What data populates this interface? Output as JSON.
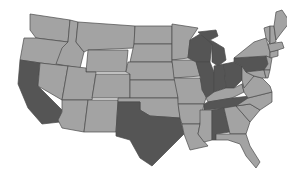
{
  "map": {
    "title": "United States map with highlighted states",
    "colors": {
      "background": "#ffffff",
      "default_state": "#a3a3a3",
      "highlighted_state": "#555555",
      "border": "#4a4a4a"
    },
    "highlighted_states": [
      "California",
      "Texas",
      "Wisconsin",
      "Michigan",
      "Illinois",
      "Indiana",
      "Ohio",
      "Pennsylvania",
      "Tennessee",
      "Alabama"
    ],
    "states": [
      {
        "id": "WA",
        "name": "Washington",
        "highlighted": false,
        "points": "30,14 70,20 68,42 36,38 30,30"
      },
      {
        "id": "OR",
        "name": "Oregon",
        "highlighted": false,
        "points": "24,38 36,38 68,42 62,66 20,60"
      },
      {
        "id": "CA",
        "name": "California",
        "highlighted": true,
        "points": "20,60 40,63 38,86 62,110 60,122 42,124 28,108 18,84"
      },
      {
        "id": "ID",
        "name": "Idaho",
        "highlighted": false,
        "points": "70,20 78,22 76,42 84,52 80,68 56,64 62,48 68,42"
      },
      {
        "id": "NV",
        "name": "Nevada",
        "highlighted": false,
        "points": "40,63 68,66 62,100 38,86"
      },
      {
        "id": "MT",
        "name": "Montana",
        "highlighted": false,
        "points": "78,22 135,26 134,48 88,50 84,52 76,42"
      },
      {
        "id": "WY",
        "name": "Wyoming",
        "highlighted": false,
        "points": "88,50 128,50 126,72 86,72"
      },
      {
        "id": "UT",
        "name": "Utah",
        "highlighted": false,
        "points": "68,66 86,68 86,72 96,72 92,100 62,100"
      },
      {
        "id": "CO",
        "name": "Colorado",
        "highlighted": false,
        "points": "96,74 130,74 130,98 92,98"
      },
      {
        "id": "AZ",
        "name": "Arizona",
        "highlighted": false,
        "points": "62,100 88,100 84,132 62,128 58,120 62,112"
      },
      {
        "id": "NM",
        "name": "New Mexico",
        "highlighted": false,
        "points": "88,100 118,100 116,132 84,132"
      },
      {
        "id": "ND",
        "name": "North Dakota",
        "highlighted": false,
        "points": "135,26 172,26 172,44 134,44"
      },
      {
        "id": "SD",
        "name": "South Dakota",
        "highlighted": false,
        "points": "134,44 172,44 172,62 130,62"
      },
      {
        "id": "NE",
        "name": "Nebraska",
        "highlighted": false,
        "points": "128,62 172,62 176,80 130,80 130,74 126,72"
      },
      {
        "id": "KS",
        "name": "Kansas",
        "highlighted": false,
        "points": "130,80 178,80 178,98 130,98"
      },
      {
        "id": "OK",
        "name": "Oklahoma",
        "highlighted": false,
        "points": "118,98 178,98 180,118 150,116 140,110 140,102 118,102"
      },
      {
        "id": "TX",
        "name": "Texas",
        "highlighted": true,
        "points": "118,102 140,102 140,110 150,116 180,118 184,134 170,148 152,166 140,158 130,140 116,136 116,132"
      },
      {
        "id": "MN",
        "name": "Minnesota",
        "highlighted": false,
        "points": "172,24 198,28 190,40 188,58 172,60"
      },
      {
        "id": "IA",
        "name": "Iowa",
        "highlighted": false,
        "points": "172,60 196,60 200,76 174,78"
      },
      {
        "id": "MO",
        "name": "Missouri",
        "highlighted": false,
        "points": "174,78 200,78 206,98 204,104 178,104 178,98"
      },
      {
        "id": "AR",
        "name": "Arkansas",
        "highlighted": false,
        "points": "178,104 204,104 200,124 182,124 180,118"
      },
      {
        "id": "LA",
        "name": "Louisiana",
        "highlighted": false,
        "points": "182,124 200,124 198,134 208,146 190,150 184,134"
      },
      {
        "id": "WI",
        "name": "Wisconsin",
        "highlighted": true,
        "points": "190,40 200,34 208,38 212,44 210,62 196,62 188,58"
      },
      {
        "id": "IL",
        "name": "Illinois",
        "highlighted": true,
        "points": "196,62 210,62 214,72 214,92 208,100 202,90 200,76"
      },
      {
        "id": "MI",
        "name": "Michigan",
        "highlighted": true,
        "points": "198,32 216,30 218,36 210,40 214,42 224,48 226,60 218,66 212,62 212,44"
      },
      {
        "id": "IN",
        "name": "Indiana",
        "highlighted": true,
        "points": "214,66 224,64 226,88 214,92"
      },
      {
        "id": "OH",
        "name": "Ohio",
        "highlighted": true,
        "points": "224,64 234,62 242,66 242,80 234,88 226,88"
      },
      {
        "id": "KY",
        "name": "Kentucky",
        "highlighted": false,
        "points": "206,98 214,92 226,88 234,88 242,84 244,92 232,98 208,102"
      },
      {
        "id": "TN",
        "name": "Tennessee",
        "highlighted": true,
        "points": "204,104 208,102 232,98 250,96 248,104 226,108 204,110"
      },
      {
        "id": "MS",
        "name": "Mississippi",
        "highlighted": false,
        "points": "200,110 212,110 212,140 204,142 198,134 200,124"
      },
      {
        "id": "AL",
        "name": "Alabama",
        "highlighted": true,
        "points": "212,110 224,108 230,132 216,134 216,140 212,140"
      },
      {
        "id": "GA",
        "name": "Georgia",
        "highlighted": false,
        "points": "224,108 236,106 250,122 246,134 230,134"
      },
      {
        "id": "FL",
        "name": "Florida",
        "highlighted": false,
        "points": "216,134 230,134 246,134 250,146 260,162 256,168 246,156 240,144 228,140 216,140"
      },
      {
        "id": "SC",
        "name": "South Carolina",
        "highlighted": false,
        "points": "236,106 250,104 260,110 250,122"
      },
      {
        "id": "NC",
        "name": "North Carolina",
        "highlighted": false,
        "points": "248,98 272,92 272,102 260,110 250,104 236,106"
      },
      {
        "id": "VA",
        "name": "Virginia",
        "highlighted": false,
        "points": "242,84 254,76 262,78 270,86 272,92 248,98 244,92"
      },
      {
        "id": "WV",
        "name": "West Virginia",
        "highlighted": false,
        "points": "242,66 246,72 254,76 244,88 242,80"
      },
      {
        "id": "PA",
        "name": "Pennsylvania",
        "highlighted": true,
        "points": "234,58 266,56 268,64 264,70 246,72 242,66 234,62"
      },
      {
        "id": "NY",
        "name": "New York",
        "highlighted": false,
        "points": "234,58 244,50 254,42 266,38 270,52 270,58 266,56"
      },
      {
        "id": "NJ",
        "name": "New Jersey",
        "highlighted": false,
        "points": "266,56 272,58 270,70 264,70 268,64"
      },
      {
        "id": "MD",
        "name": "Maryland",
        "highlighted": false,
        "points": "246,72 264,70 266,78 262,78 254,76"
      },
      {
        "id": "DE",
        "name": "Delaware",
        "highlighted": false,
        "points": "264,70 270,70 268,78 266,78"
      },
      {
        "id": "CT",
        "name": "Connecticut",
        "highlighted": false,
        "points": "270,52 278,50 278,56 270,58"
      },
      {
        "id": "MA",
        "name": "Massachusetts",
        "highlighted": false,
        "points": "268,44 282,42 284,48 278,50 270,52"
      },
      {
        "id": "VT",
        "name": "Vermont",
        "highlighted": false,
        "points": "264,28 270,26 270,44 266,38"
      },
      {
        "id": "NH",
        "name": "New Hampshire",
        "highlighted": false,
        "points": "270,26 274,26 276,42 270,44"
      },
      {
        "id": "ME",
        "name": "Maine",
        "highlighted": false,
        "points": "274,26 276,12 282,10 290,22 282,32 276,40"
      }
    ]
  }
}
